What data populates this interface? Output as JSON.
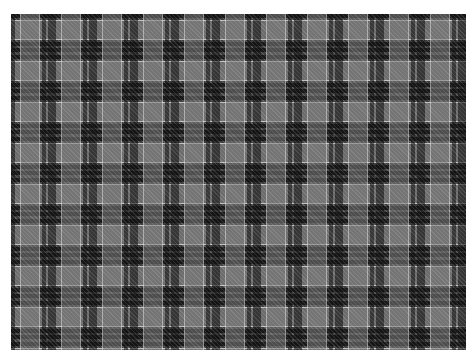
{
  "image": {
    "subject": "grayscale tartan plaid fabric pattern",
    "colors": {
      "background": "#ffffff",
      "dark_hatch": "#3d3d3d",
      "black_stripe": "#111111",
      "gray_square": "#7a7a7a",
      "white_line": "#d6d6d6"
    },
    "pattern_repeat_px": 41
  },
  "caption": {
    "text": " "
  }
}
